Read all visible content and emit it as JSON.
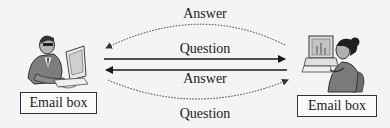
{
  "diagram": {
    "type": "email-exchange",
    "nodes": [
      {
        "id": "sender",
        "label": "Email box",
        "figure": "man-at-computer-icon"
      },
      {
        "id": "receiver",
        "label": "Email box",
        "figure": "woman-at-computer-icon"
      }
    ],
    "edges": [
      {
        "from": "receiver",
        "to": "sender",
        "label": "Answer",
        "style": "dotted-arc-top"
      },
      {
        "from": "sender",
        "to": "receiver",
        "label": "Question",
        "style": "solid"
      },
      {
        "from": "receiver",
        "to": "sender",
        "label": "Answer",
        "style": "solid"
      },
      {
        "from": "sender",
        "to": "receiver",
        "label": "Question",
        "style": "dotted-arc-bottom"
      }
    ]
  },
  "labels": {
    "top_answer": "Answer",
    "solid_question": "Question",
    "solid_answer": "Answer",
    "bottom_question": "Question",
    "left_box": "Email box",
    "right_box": "Email box"
  }
}
